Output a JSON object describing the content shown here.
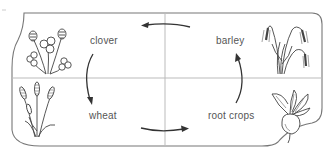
{
  "diagram": {
    "type": "cycle",
    "title": "",
    "colors": {
      "border": "#777777",
      "divider": "#bbbbbb",
      "arrow": "#333333",
      "text": "#555555",
      "plant": "#444444",
      "background": "#ffffff"
    },
    "nodes": [
      {
        "id": "clover",
        "label": "clover",
        "position": "top-left",
        "icon": "clover-plant-icon"
      },
      {
        "id": "barley",
        "label": "barley",
        "position": "top-right",
        "icon": "barley-plant-icon"
      },
      {
        "id": "wheat",
        "label": "wheat",
        "position": "bottom-left",
        "icon": "wheat-plant-icon"
      },
      {
        "id": "root_crops",
        "label": "root crops",
        "position": "bottom-right",
        "icon": "beet-root-icon"
      }
    ],
    "edges": [
      {
        "from": "barley",
        "to": "clover",
        "position": "top",
        "direction": "left"
      },
      {
        "from": "clover",
        "to": "wheat",
        "position": "left",
        "direction": "down"
      },
      {
        "from": "wheat",
        "to": "root_crops",
        "position": "bottom",
        "direction": "right"
      },
      {
        "from": "root_crops",
        "to": "barley",
        "position": "right",
        "direction": "up"
      }
    ],
    "cycle_order": [
      "clover",
      "wheat",
      "root crops",
      "barley"
    ]
  }
}
